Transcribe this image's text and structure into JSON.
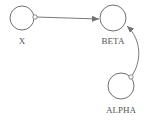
{
  "diagram": {
    "nodes": [
      {
        "id": "X",
        "label": "X",
        "cx": 22,
        "cy": 18,
        "r": 12
      },
      {
        "id": "BETA",
        "label": "BETA",
        "cx": 113,
        "cy": 18,
        "r": 13
      },
      {
        "id": "ALPHA",
        "label": "ALPHA",
        "cx": 121,
        "cy": 86,
        "r": 13
      }
    ],
    "edges": [
      {
        "from": "X",
        "to": "BETA",
        "style": "straight-arrow"
      },
      {
        "from": "ALPHA",
        "to": "BETA",
        "style": "curved-arrow"
      }
    ],
    "colors": {
      "stroke": "#707070",
      "text": "#555555",
      "background": "#ffffff"
    }
  }
}
